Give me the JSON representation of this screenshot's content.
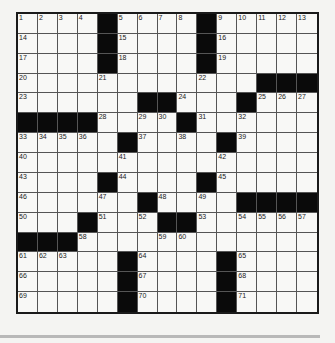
{
  "puzzle": {
    "rows": 15,
    "cols": 15,
    "grid": [
      [
        "1",
        "2",
        "3",
        "4",
        "#",
        "5",
        "6",
        "7",
        "8",
        "#",
        "9",
        "10",
        "11",
        "12",
        "13"
      ],
      [
        "14",
        "",
        "",
        "",
        "#",
        "15",
        "",
        "",
        "",
        "#",
        "16",
        "",
        "",
        "",
        ""
      ],
      [
        "17",
        "",
        "",
        "",
        "#",
        "18",
        "",
        "",
        "",
        "#",
        "19",
        "",
        "",
        "",
        ""
      ],
      [
        "20",
        "",
        "",
        "",
        "21",
        "",
        "",
        "",
        "",
        "22",
        "",
        "",
        "#",
        "#",
        "#"
      ],
      [
        "23",
        "",
        "",
        "",
        "",
        "",
        "#",
        "#",
        "24",
        "",
        "",
        "#",
        "25",
        "26",
        "27"
      ],
      [
        "#",
        "#",
        "#",
        "#",
        "28",
        "",
        "29",
        "30",
        "#",
        "31",
        "",
        "32",
        "",
        "",
        ""
      ],
      [
        "33",
        "34",
        "35",
        "36",
        "",
        "#",
        "37",
        "",
        "38",
        "",
        "#",
        "39",
        "",
        "",
        ""
      ],
      [
        "40",
        "",
        "",
        "",
        "",
        "41",
        "",
        "",
        "",
        "",
        "42",
        "",
        "",
        "",
        ""
      ],
      [
        "43",
        "",
        "",
        "",
        "#",
        "44",
        "",
        "",
        "",
        "#",
        "45",
        "",
        "",
        "",
        ""
      ],
      [
        "46",
        "",
        "",
        "",
        "47",
        "",
        "#",
        "48",
        "",
        "49",
        "",
        "#",
        "#",
        "#",
        "#"
      ],
      [
        "50",
        "",
        "",
        "#",
        "51",
        "",
        "52",
        "#",
        "#",
        "53",
        "",
        "54",
        "55",
        "56",
        "57"
      ],
      [
        "#",
        "#",
        "#",
        "58",
        "",
        "",
        "",
        "59",
        "60",
        "",
        "",
        "",
        "",
        "",
        ""
      ],
      [
        "61",
        "62",
        "63",
        "",
        "",
        "#",
        "64",
        "",
        "",
        "",
        "#",
        "65",
        "",
        "",
        ""
      ],
      [
        "66",
        "",
        "",
        "",
        "",
        "#",
        "67",
        "",
        "",
        "",
        "#",
        "68",
        "",
        "",
        ""
      ],
      [
        "69",
        "",
        "",
        "",
        "",
        "#",
        "70",
        "",
        "",
        "",
        "#",
        "71",
        "",
        "",
        ""
      ]
    ]
  }
}
